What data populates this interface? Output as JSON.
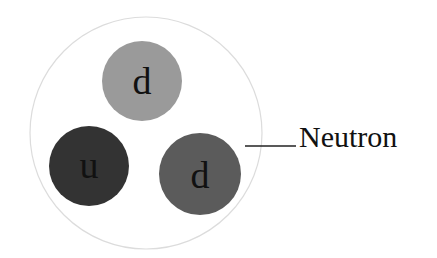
{
  "diagram": {
    "particle_label": "Neutron",
    "particle_outline_color": "#dcdcdc",
    "quarks": [
      {
        "label": "d",
        "cx": 142,
        "cy": 81,
        "r": 40,
        "color": "#9a9a9a"
      },
      {
        "label": "u",
        "cx": 89,
        "cy": 166,
        "r": 40,
        "color": "#333333"
      },
      {
        "label": "d",
        "cx": 200,
        "cy": 174,
        "r": 41,
        "color": "#5b5b5b"
      }
    ]
  }
}
